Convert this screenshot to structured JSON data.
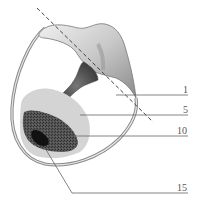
{
  "figure": {
    "type": "patent-drawing",
    "reference_labels": [
      {
        "id": "1",
        "text": "1",
        "target": "interior cavity"
      },
      {
        "id": "5",
        "text": "5",
        "target": "light gray filled region"
      },
      {
        "id": "10",
        "text": "10",
        "target": "dark stippled region"
      },
      {
        "id": "15",
        "text": "15",
        "target": "black core"
      }
    ],
    "colors": {
      "shell": "#9a9a9a",
      "shell_highlight": "#e6e6e6",
      "light_region": "#d4d4d4",
      "dark_region": "#4a4a4a",
      "core": "#111111",
      "leader_lines": "#666666",
      "dashed_axis": "#444444"
    }
  }
}
